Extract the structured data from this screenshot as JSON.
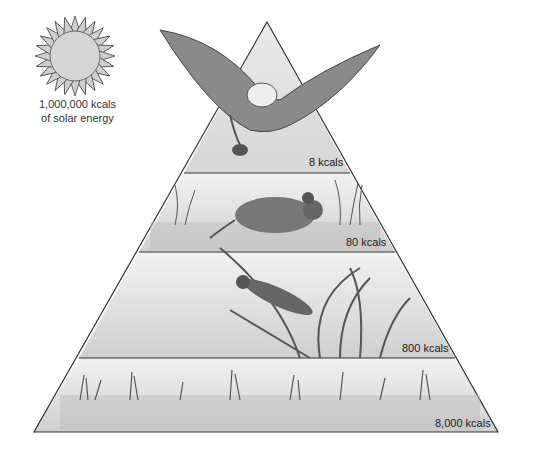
{
  "sun": {
    "line1": "1,000,000 kcals",
    "line2": "of solar energy"
  },
  "levels": [
    {
      "name": "tertiary consumer (eagle)",
      "label": "8 kcals"
    },
    {
      "name": "secondary consumer (mouse)",
      "label": "80 kcals"
    },
    {
      "name": "primary consumer (grasshopper)",
      "label": "800 kcals"
    },
    {
      "name": "producers (plants)",
      "label": "8,000 kcals"
    }
  ]
}
